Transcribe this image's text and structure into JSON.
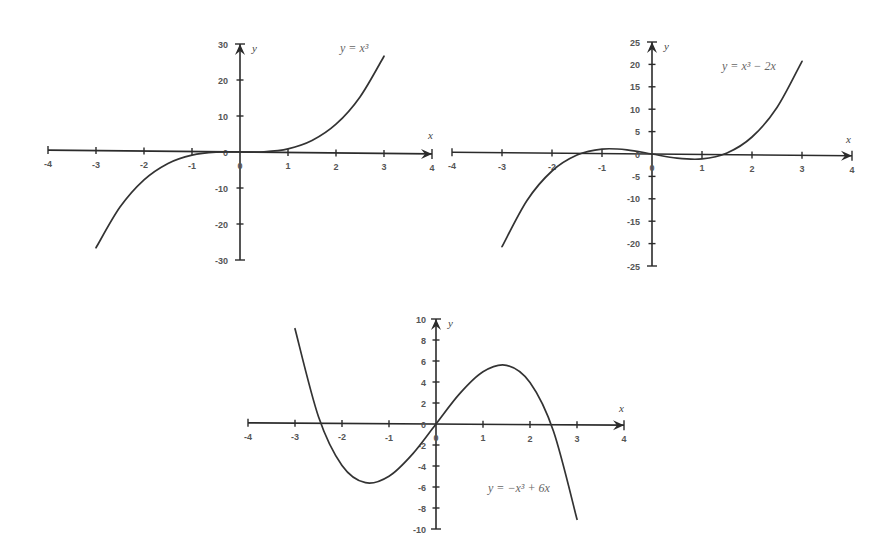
{
  "figure": {
    "background": "#ffffff",
    "line_color": "#333333"
  },
  "chart_data": [
    {
      "type": "line",
      "title": "y = x³",
      "formula_label": "y = x³",
      "xlabel": "x",
      "ylabel": "y",
      "xlim": [
        -4,
        4
      ],
      "ylim": [
        -30,
        30
      ],
      "x_ticks": [
        -4,
        -3,
        -2,
        -1,
        0,
        1,
        2,
        3,
        4
      ],
      "y_ticks": [
        30,
        20,
        10,
        0,
        -10,
        -20,
        -30
      ],
      "grid": false,
      "series": [
        {
          "name": "y = x^3",
          "x": [
            -3,
            -2.5,
            -2,
            -1.5,
            -1,
            -0.5,
            0,
            0.5,
            1,
            1.5,
            2,
            2.5,
            3
          ],
          "values": [
            -27,
            -15.63,
            -8,
            -3.38,
            -1,
            -0.13,
            0,
            0.13,
            1,
            3.38,
            8,
            15.63,
            27
          ]
        }
      ]
    },
    {
      "type": "line",
      "title": "y = x³ − 2x",
      "formula_label": "y = x³ − 2x",
      "xlabel": "x",
      "ylabel": "y",
      "xlim": [
        -4,
        4
      ],
      "ylim": [
        -25,
        25
      ],
      "x_ticks": [
        -4,
        -3,
        -2,
        -1,
        0,
        1,
        2,
        3,
        4
      ],
      "y_ticks": [
        25,
        20,
        15,
        10,
        5,
        0,
        -5,
        -10,
        -15,
        -20,
        -25
      ],
      "grid": false,
      "series": [
        {
          "name": "y = x^3 - 2x",
          "x": [
            -3,
            -2.5,
            -2,
            -1.5,
            -1,
            -0.5,
            0,
            0.5,
            1,
            1.5,
            2,
            2.5,
            3
          ],
          "values": [
            -21,
            -10.63,
            -4,
            -0.38,
            1,
            0.88,
            0,
            -0.88,
            -1,
            0.38,
            4,
            10.63,
            21
          ]
        }
      ]
    },
    {
      "type": "line",
      "title": "y = −x³ + 6x",
      "formula_label": "y = −x³ + 6x",
      "xlabel": "x",
      "ylabel": "y",
      "xlim": [
        -4,
        4
      ],
      "ylim": [
        -10,
        10
      ],
      "x_ticks": [
        -4,
        -3,
        -2,
        -1,
        0,
        1,
        2,
        3,
        4
      ],
      "y_ticks": [
        10,
        8,
        6,
        4,
        2,
        0,
        -2,
        -4,
        -6,
        -8,
        -10
      ],
      "grid": false,
      "series": [
        {
          "name": "y = -x^3 + 6x",
          "x": [
            -3,
            -2.5,
            -2,
            -1.5,
            -1,
            -0.5,
            0,
            0.5,
            1,
            1.5,
            2,
            2.5,
            3
          ],
          "values": [
            9,
            0.63,
            -4,
            -5.63,
            -5,
            -2.88,
            0,
            2.88,
            5,
            5.63,
            4,
            -0.63,
            -9
          ]
        }
      ]
    }
  ]
}
